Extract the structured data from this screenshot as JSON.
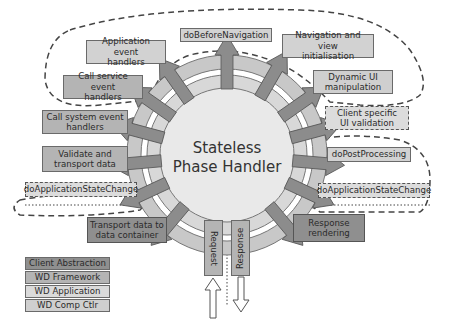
{
  "diagram": {
    "center": {
      "line1": "Stateless",
      "line2": "Phase Handler"
    },
    "boxes": {
      "app_event": {
        "line1": "Application event",
        "line2": "handlers"
      },
      "call_service": {
        "line1": "Call service event",
        "line2": "handlers"
      },
      "call_system": {
        "line1": "Call system event",
        "line2": "handlers"
      },
      "validate": {
        "line1": "Validate and",
        "line2": "transport data"
      },
      "do_asc_left": {
        "label": "doApplicationStateChange"
      },
      "transport_container": {
        "line1": "Transport data to",
        "line2": "data container"
      },
      "do_before_nav": {
        "label": "doBeforeNavigation"
      },
      "nav_view_init": {
        "line1": "Navigation and view",
        "line2": "initialisation"
      },
      "dynamic_ui": {
        "line1": "Dynamic UI",
        "line2": "manipulation"
      },
      "client_validation": {
        "line1": "Client specific",
        "line2": "UI validation"
      },
      "do_post": {
        "label": "doPostProcessing"
      },
      "do_asc_right": {
        "label": "doApplicationStateChange"
      },
      "response_rendering": {
        "line1": "Response",
        "line2": "rendering"
      },
      "request": {
        "label": "Request"
      },
      "response": {
        "label": "Response"
      }
    },
    "legend": [
      {
        "label": "Client Abstraction",
        "color": "#8f8f8f"
      },
      {
        "label": "WD Framework",
        "color": "#b4b4b4"
      },
      {
        "label": "WD Application",
        "color": "#d2d2d2"
      },
      {
        "label": "WD Comp Ctlr",
        "color": "#cfcfcf"
      }
    ],
    "colors": {
      "ring_outer": "#c8c8c8",
      "ring_inner": "#ebebeb",
      "core": "#e9e9e9",
      "arrow": "#8c8c8c",
      "arrow_stroke": "#555555"
    }
  }
}
